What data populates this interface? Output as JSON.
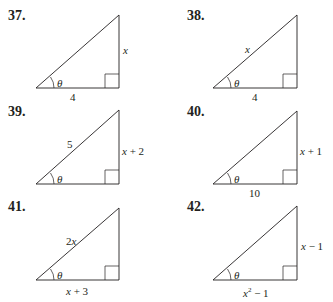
{
  "problems": [
    {
      "number": "37.",
      "hypotenuse": "",
      "opposite": "x",
      "adjacent": "4",
      "angle": "θ"
    },
    {
      "number": "38.",
      "hypotenuse": "x",
      "opposite": "",
      "adjacent": "4",
      "angle": "θ"
    },
    {
      "number": "39.",
      "hypotenuse": "5",
      "opposite": "x + 2",
      "adjacent": "",
      "angle": "θ"
    },
    {
      "number": "40.",
      "hypotenuse": "",
      "opposite": "x + 1",
      "adjacent": "10",
      "angle": "θ"
    },
    {
      "number": "41.",
      "hypotenuse": "2x",
      "opposite": "",
      "adjacent": "x + 3",
      "angle": "θ"
    },
    {
      "number": "42.",
      "hypotenuse": "",
      "opposite": "x − 1",
      "adjacent_base": "x",
      "adjacent_exp": "2",
      "adjacent_tail": " − 1",
      "angle": "θ"
    }
  ],
  "colors": {
    "ink": "#231f20",
    "background": "#ffffff"
  }
}
